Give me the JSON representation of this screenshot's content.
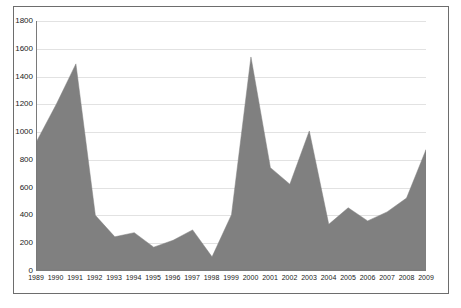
{
  "chart_data": {
    "type": "area",
    "title": "",
    "subtitle": "",
    "xlabel": "",
    "ylabel": "",
    "categories": [
      "1989",
      "1990",
      "1991",
      "1992",
      "1993",
      "1994",
      "1995",
      "1996",
      "1997",
      "1998",
      "1999",
      "2000",
      "2001",
      "2002",
      "2003",
      "2004",
      "2005",
      "2006",
      "2007",
      "2008",
      "2009"
    ],
    "values": [
      935,
      1200,
      1490,
      395,
      240,
      270,
      165,
      215,
      290,
      95,
      400,
      1540,
      740,
      620,
      1005,
      330,
      450,
      355,
      420,
      520,
      870
    ],
    "series": [
      {
        "name": "",
        "values": [
          935,
          1200,
          1490,
          395,
          240,
          270,
          165,
          215,
          290,
          95,
          400,
          1540,
          740,
          620,
          1005,
          330,
          450,
          355,
          420,
          520,
          870
        ]
      }
    ],
    "ylim": [
      0,
      1800
    ],
    "y_ticks": [
      0,
      200,
      400,
      600,
      800,
      1000,
      1200,
      1400,
      1600,
      1800
    ],
    "y_tick_labels": [
      "0",
      "200",
      "400",
      "600",
      "800",
      "1000",
      "1200",
      "1400",
      "1600",
      "1800"
    ],
    "x_tick_labels": [
      "1989",
      "1990",
      "1991",
      "1992",
      "1993",
      "1994",
      "1995",
      "1996",
      "1997",
      "1998",
      "1999",
      "2000",
      "2001",
      "2002",
      "2003",
      "2004",
      "2005",
      "2006",
      "2007",
      "2008",
      "2009"
    ],
    "grid": true,
    "grid_axis": "y",
    "legend": false,
    "legend_position": "none",
    "colors": {
      "area_fill": "#808080",
      "area_stroke": "#808080",
      "gridline": "#e2e2e2",
      "axis_line": "#7a7a7a",
      "frame_border": "#6d6d6d",
      "background": "#ffffff",
      "tick_text": "#1a1a1a"
    }
  }
}
